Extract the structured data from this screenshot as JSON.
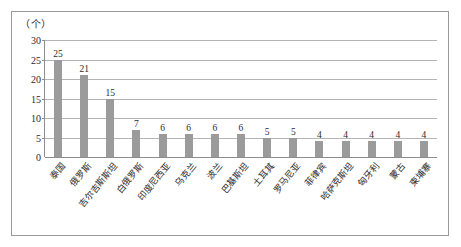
{
  "chart_data": {
    "type": "bar",
    "title": "",
    "subtitle": "",
    "xlabel": "",
    "ylabel": "",
    "unit_label": "（个）",
    "ylim": [
      0,
      30
    ],
    "yticks": [
      0,
      5,
      10,
      15,
      20,
      25,
      30
    ],
    "ytick_labels": [
      "0",
      "5",
      "10",
      "15",
      "20",
      "25",
      "30"
    ],
    "grid": true,
    "legend": null,
    "bar_color": "#9b9b9b",
    "categories": [
      "泰国",
      "俄罗斯",
      "吉尔吉斯斯坦",
      "白俄罗斯",
      "印度尼西亚",
      "乌克兰",
      "波兰",
      "巴基斯坦",
      "土耳其",
      "罗马尼亚",
      "菲律宾",
      "哈萨克斯坦",
      "匈牙利",
      "蒙古",
      "柬埔寨"
    ],
    "values": [
      25,
      21,
      15,
      7,
      6,
      6,
      6,
      6,
      5,
      5,
      4,
      4,
      4,
      4,
      4
    ],
    "value_labels": [
      "25",
      "21",
      "15",
      "7",
      "6",
      "6",
      "6",
      "6",
      "5",
      "5",
      "4",
      "4",
      "4",
      "4",
      "4"
    ]
  }
}
